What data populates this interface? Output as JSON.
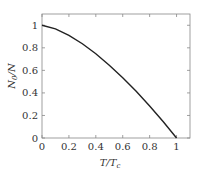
{
  "chart_data": {
    "type": "line",
    "title": "",
    "xlabel": "T/T_c",
    "ylabel": "N_0/N",
    "xlim": [
      0,
      1.1
    ],
    "ylim": [
      0,
      1.1
    ],
    "grid": false,
    "legend": null,
    "xticks": [
      0,
      0.2,
      0.4,
      0.6,
      0.8,
      1
    ],
    "xtick_labels": [
      "0",
      "0.2",
      "0.4",
      "0.6",
      "0.8",
      "1"
    ],
    "yticks": [
      0,
      0.2,
      0.4,
      0.6,
      0.8,
      1
    ],
    "ytick_labels": [
      "0",
      "0.2",
      "0.4",
      "0.6",
      "0.8",
      "1"
    ],
    "series": [
      {
        "name": "condensate fraction",
        "color": "#222222",
        "x": [
          0,
          0.1,
          0.2,
          0.3,
          0.4,
          0.5,
          0.6,
          0.7,
          0.8,
          0.9,
          1.0
        ],
        "y": [
          1.0,
          0.968,
          0.911,
          0.836,
          0.747,
          0.646,
          0.535,
          0.414,
          0.284,
          0.146,
          0.0
        ]
      }
    ]
  },
  "labels": {
    "x_axis_main": "T/T",
    "x_axis_sub": "c",
    "y_axis_main": "N",
    "y_axis_sub": "0",
    "y_axis_tail": "/N"
  }
}
